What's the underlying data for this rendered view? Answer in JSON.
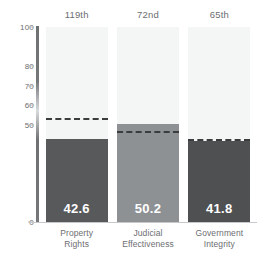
{
  "chart_data": {
    "type": "bar",
    "title": "",
    "subtitle": "",
    "xlabel": "",
    "ylabel": "",
    "ylim": [
      0,
      100
    ],
    "grid": false,
    "legend_position": "none",
    "categories": [
      "Property Rights",
      "Judicial Effectiveness",
      "Government Integrity"
    ],
    "category_lines": [
      [
        "Property",
        "Rights"
      ],
      [
        "Judicial",
        "Effectiveness"
      ],
      [
        "Government",
        "Integrity"
      ]
    ],
    "values": [
      42.6,
      50.2,
      41.8
    ],
    "value_labels": [
      "42.6",
      "50.2",
      "41.8"
    ],
    "rank_labels": [
      "119th",
      "72nd",
      "65th"
    ],
    "benchmark_values": [
      52.5,
      45.5,
      41.8
    ],
    "bar_colors": [
      "#58595b",
      "#8e9194",
      "#4e5052"
    ],
    "yticks": [
      {
        "value": 100,
        "label": "100"
      },
      {
        "value": 80,
        "label": "80"
      },
      {
        "value": 70,
        "label": "70"
      },
      {
        "value": 60,
        "label": "60"
      },
      {
        "value": 50,
        "label": "50"
      },
      {
        "value": 0,
        "label": "0"
      }
    ],
    "colors": {
      "background": "#ffffff",
      "column_background": "#f4f5f5",
      "axis": "#6f7072",
      "baseline": "#c7c8ca",
      "tick_text": "#6d6e71",
      "benchmark_dash": "#3b3c3e",
      "value_text": "#ffffff"
    }
  }
}
